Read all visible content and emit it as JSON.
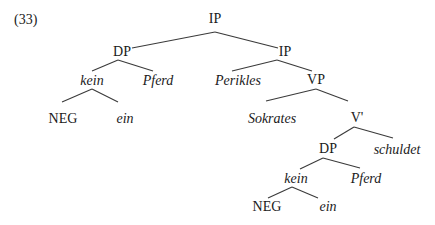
{
  "example_number": "(33)",
  "tree": {
    "nodes": [
      {
        "id": "ip_root",
        "label": "IP",
        "italic": false,
        "x": 215,
        "y": 19
      },
      {
        "id": "dp_subj",
        "label": "DP",
        "italic": false,
        "x": 122,
        "y": 52
      },
      {
        "id": "ip_inner",
        "label": "IP",
        "italic": false,
        "x": 285,
        "y": 52
      },
      {
        "id": "kein_1",
        "label": "kein",
        "italic": true,
        "x": 92,
        "y": 81
      },
      {
        "id": "pferd_1",
        "label": "Pferd",
        "italic": true,
        "x": 158,
        "y": 81
      },
      {
        "id": "perikles",
        "label": "Perikles",
        "italic": true,
        "x": 238,
        "y": 81
      },
      {
        "id": "vp",
        "label": "VP",
        "italic": false,
        "x": 316,
        "y": 80
      },
      {
        "id": "neg_1",
        "label": "NEG",
        "italic": false,
        "x": 63,
        "y": 119
      },
      {
        "id": "ein_1",
        "label": "ein",
        "italic": true,
        "x": 125,
        "y": 119
      },
      {
        "id": "sokrates",
        "label": "Sokrates",
        "italic": true,
        "x": 272,
        "y": 119
      },
      {
        "id": "vbar",
        "label": "V'",
        "italic": false,
        "x": 357,
        "y": 118
      },
      {
        "id": "dp_obj",
        "label": "DP",
        "italic": false,
        "x": 328,
        "y": 149
      },
      {
        "id": "schuldet",
        "label": "schuldet",
        "italic": true,
        "x": 397,
        "y": 150
      },
      {
        "id": "kein_2",
        "label": "kein",
        "italic": true,
        "x": 296,
        "y": 179
      },
      {
        "id": "pferd_2",
        "label": "Pferd",
        "italic": true,
        "x": 366,
        "y": 179
      },
      {
        "id": "neg_2",
        "label": "NEG",
        "italic": false,
        "x": 267,
        "y": 207
      },
      {
        "id": "ein_2",
        "label": "ein",
        "italic": true,
        "x": 328,
        "y": 207
      }
    ],
    "edges": [
      {
        "from": "ip_root",
        "to": "dp_subj",
        "x1": 215,
        "y1": 32,
        "x2": 132,
        "y2": 48
      },
      {
        "from": "ip_root",
        "to": "ip_inner",
        "x1": 215,
        "y1": 32,
        "x2": 278,
        "y2": 48
      },
      {
        "from": "dp_subj",
        "to": "kein_1",
        "x1": 118,
        "y1": 60,
        "x2": 92,
        "y2": 71
      },
      {
        "from": "dp_subj",
        "to": "pferd_1",
        "x1": 118,
        "y1": 60,
        "x2": 153,
        "y2": 71
      },
      {
        "from": "ip_inner",
        "to": "perikles",
        "x1": 277,
        "y1": 60,
        "x2": 232,
        "y2": 71
      },
      {
        "from": "ip_inner",
        "to": "vp",
        "x1": 277,
        "y1": 60,
        "x2": 312,
        "y2": 71
      },
      {
        "from": "kein_1",
        "to": "neg_1",
        "x1": 92,
        "y1": 89,
        "x2": 62,
        "y2": 102
      },
      {
        "from": "kein_1",
        "to": "ein_1",
        "x1": 92,
        "y1": 89,
        "x2": 118,
        "y2": 102
      },
      {
        "from": "vp",
        "to": "sokrates",
        "x1": 316,
        "y1": 89,
        "x2": 266,
        "y2": 101
      },
      {
        "from": "vp",
        "to": "vbar",
        "x1": 316,
        "y1": 89,
        "x2": 348,
        "y2": 101
      },
      {
        "from": "vbar",
        "to": "dp_obj",
        "x1": 354,
        "y1": 127,
        "x2": 334,
        "y2": 139
      },
      {
        "from": "vbar",
        "to": "schuldet",
        "x1": 354,
        "y1": 127,
        "x2": 393,
        "y2": 138
      },
      {
        "from": "dp_obj",
        "to": "kein_2",
        "x1": 323,
        "y1": 158,
        "x2": 300,
        "y2": 169
      },
      {
        "from": "dp_obj",
        "to": "pferd_2",
        "x1": 323,
        "y1": 158,
        "x2": 360,
        "y2": 168
      },
      {
        "from": "kein_2",
        "to": "neg_2",
        "x1": 292,
        "y1": 187,
        "x2": 268,
        "y2": 198
      },
      {
        "from": "kein_2",
        "to": "ein_2",
        "x1": 292,
        "y1": 187,
        "x2": 318,
        "y2": 198
      }
    ]
  }
}
